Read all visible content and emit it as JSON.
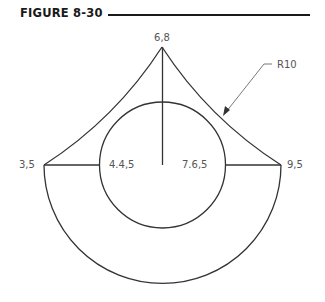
{
  "figure": {
    "title": "FIGURE 8-30"
  },
  "labels": {
    "apex": "6,8",
    "left_point": "3,5",
    "right_point": "9,5",
    "circle_left": "4.4,5",
    "circle_right": "7.6,5",
    "radius_callout": "R10"
  },
  "geometry": {
    "stroke_color": "#333333",
    "apex": [
      6,
      8
    ],
    "left_point": [
      3,
      5
    ],
    "right_point": [
      9,
      5
    ],
    "center": [
      6,
      5
    ],
    "circle_radius": 1.6,
    "outer_arc_radius": 3,
    "side_arc_radius": 10
  }
}
